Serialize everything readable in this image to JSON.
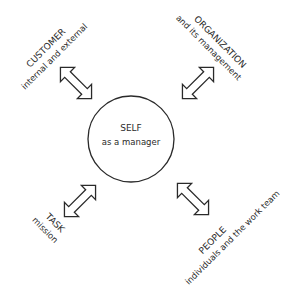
{
  "center": {
    "title": "SELF",
    "subtitle": "as a manager"
  },
  "nodes": [
    {
      "id": "customer",
      "title": "CUSTOMER",
      "subtitle": "internal and external",
      "position": "top-left"
    },
    {
      "id": "organization",
      "title": "ORGANIZATION",
      "subtitle": "and its management",
      "position": "top-right"
    },
    {
      "id": "task",
      "title": "TASK",
      "subtitle": "mission",
      "position": "bottom-left"
    },
    {
      "id": "people",
      "title": "PEOPLE",
      "subtitle": "individuals and the work team",
      "position": "bottom-right"
    }
  ],
  "connectors": [
    {
      "from": "self",
      "to": "customer",
      "type": "double-arrow"
    },
    {
      "from": "self",
      "to": "organization",
      "type": "double-arrow"
    },
    {
      "from": "self",
      "to": "task",
      "type": "double-arrow"
    },
    {
      "from": "self",
      "to": "people",
      "type": "double-arrow"
    }
  ],
  "colors": {
    "stroke": "#2a2a2a",
    "background": "#ffffff"
  }
}
